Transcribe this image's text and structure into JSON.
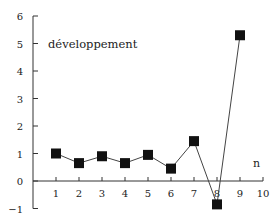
{
  "chart_data": {
    "type": "line",
    "title": "",
    "annotation": "développement",
    "xlabel": "n",
    "ylabel": "",
    "xlim": [
      0,
      10
    ],
    "ylim": [
      -1,
      6
    ],
    "x_ticks": [
      1,
      2,
      3,
      4,
      5,
      6,
      7,
      8,
      9,
      10
    ],
    "y_ticks": [
      -1,
      0,
      1,
      2,
      3,
      4,
      5,
      6
    ],
    "grid": false,
    "legend": null,
    "marker": "square",
    "series": [
      {
        "name": "développement",
        "color": "#111111",
        "x": [
          1,
          2,
          3,
          4,
          5,
          6,
          7,
          8,
          9
        ],
        "values": [
          1.0,
          0.65,
          0.9,
          0.65,
          0.95,
          0.45,
          1.45,
          -0.85,
          5.3
        ]
      }
    ]
  },
  "labels": {
    "annotation": "développement",
    "xaxis": "n"
  }
}
